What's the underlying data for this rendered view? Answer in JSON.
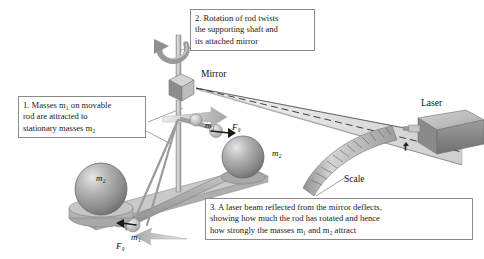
{
  "figure": {
    "background_color": "#ffffff"
  },
  "callouts": [
    {
      "id": "callout-1",
      "number": "1.",
      "lines": [
        "1. Masses m₁ on movable",
        "rod are attracted to",
        "stationary masses m₂"
      ],
      "line1": "1. Masses m₁ on movable",
      "line2": "rod are attracted to",
      "line3": "stationary masses m₂"
    },
    {
      "id": "callout-2",
      "number": "2.",
      "line1": "2. Rotation of rod twists",
      "line2": "the supporting shaft and",
      "line3": "its attached mirror"
    },
    {
      "id": "callout-3",
      "number": "3.",
      "line1": "3. A laser beam reflected from the mirror deflects,",
      "line2": "showing how much the rod has rotated and hence",
      "line3": "how strongly the masses m₁ and m₂ attract"
    }
  ],
  "part_labels": {
    "mirror": "Mirror",
    "laser": "Laser",
    "scale": "Scale"
  },
  "variable_labels": {
    "m1_left": "m₁",
    "m2_left": "m₂",
    "fg_left": "F₉",
    "m1_right": "m₁",
    "m2_right": "m₂",
    "fg_right": "F₉"
  },
  "colors": {
    "box_border": "#8b8b8b",
    "text": "#1a1a1a",
    "sphere_large": "#9a9a9a",
    "sphere_small": "#b9b9b9",
    "rod": "#a7a7a7",
    "shaft": "#b0b0b0",
    "beam_fill": "#dcdcdc",
    "arrow_gray": "#b4b4b4",
    "scale_band": "#b5b5b5",
    "laser_body": "#8f8f8f"
  }
}
